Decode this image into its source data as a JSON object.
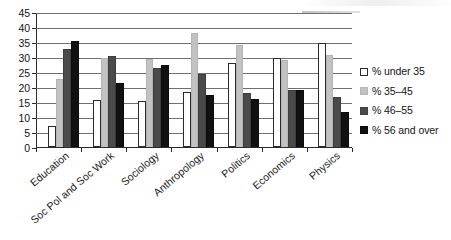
{
  "chart_data": {
    "type": "bar",
    "title": "",
    "subtitle": "",
    "xlabel": "",
    "ylabel": "",
    "ylim": [
      0,
      45
    ],
    "ytick_step": 5,
    "yticks": [
      0,
      5,
      10,
      15,
      20,
      25,
      30,
      35,
      40,
      45
    ],
    "grid": true,
    "grid_axis": "y",
    "legend_position": "right",
    "orientation": "vertical",
    "grouping": "grouped",
    "categories": [
      "Education",
      "Soc Pol and Soc Work",
      "Sociology",
      "Anthropology",
      "Politics",
      "Economics",
      "Physics"
    ],
    "series": [
      {
        "name": "% under 35",
        "color": "#ffffff",
        "values": [
          7,
          15.8,
          15.5,
          18.5,
          28,
          29.8,
          34.8
        ]
      },
      {
        "name": "% 35–45",
        "color": "#c2c2c2",
        "values": [
          22.7,
          29.6,
          29.3,
          38,
          34,
          29,
          30.6
        ]
      },
      {
        "name": "% 46–55",
        "color": "#4a4a4a",
        "values": [
          32.6,
          30.3,
          26.3,
          24.4,
          18.1,
          19,
          16.7
        ]
      },
      {
        "name": "% 56 and over",
        "color": "#111111",
        "values": [
          35.4,
          21.4,
          27.2,
          17.2,
          16,
          19,
          11.8
        ]
      }
    ]
  },
  "legend": {
    "items": [
      {
        "label": "% under 35",
        "swatch": "white-square-swatch"
      },
      {
        "label": "% 35–45",
        "swatch": "light-gray-square-swatch"
      },
      {
        "label": "% 46–55",
        "swatch": "dark-gray-square-swatch"
      },
      {
        "label": "% 56 and over",
        "swatch": "black-square-swatch"
      }
    ]
  },
  "colors": {
    "axis": "#2b2b2b",
    "gridline": "#6f6f6f",
    "background": "#ffffff",
    "text": "#141414"
  }
}
